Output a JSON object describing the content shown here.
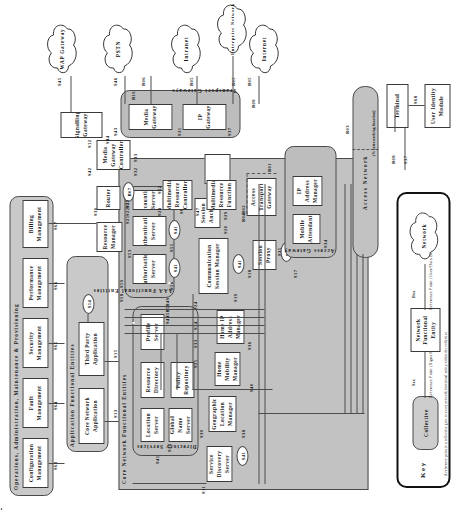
{
  "figure": {
    "type": "patent-network-architecture-diagram",
    "orientation": "rotated-90-ccw"
  },
  "collectives": {
    "oamp": {
      "label": "Operations, Administration, Maintenance & Provisioning"
    },
    "app_entities": {
      "label": "Application Functional Entities"
    },
    "core_entities": {
      "label": "Core Network Functional Entities"
    },
    "directory": {
      "label": "Directory Services"
    },
    "aaa": {
      "label": "AAA Functional Entities"
    },
    "transport_gw": {
      "label": "Transport Gateways"
    },
    "access_gw": {
      "label": "Access Gateway"
    },
    "access_network": {
      "label": "Access Network"
    },
    "access_network_note": "(% interworking function)"
  },
  "nodes": {
    "fault_mgmt": "Fault Management",
    "security_mgmt": "Security Management",
    "performance_mgmt": "Performance Management",
    "billing_mgmt": "Billing Management",
    "configuration_mgmt": "Configuration Management",
    "third_party_app": "Third Party Application",
    "core_network_app": "Core Network Application",
    "profile_server": "Profile Server",
    "policy_repository": "Policy Repository",
    "resource_directory": "Resource Directory",
    "global_name_server": "Global Name Server",
    "location_server": "Location Server",
    "service_discovery_server": "Service Discovery Server",
    "geographic_location_manager": "Geographic Location Manager",
    "home_mobility_manager": "Home Mobility Manager",
    "home_ip_address_manager": "Home IP Address Manager",
    "authorisation_server": "Authorisation Server",
    "authentication_server": "Authentication Server",
    "accounting_server": "Accounting Server",
    "communication_session_manager": "Communication Session Manager",
    "session_anchor": "Session Anchor",
    "session_proxy": "Session Proxy",
    "resource_manager": "Resource Manager",
    "router": "Router",
    "media_gateway_controller": "Media Gateway Controller",
    "multimedia_resource_controller": "Multimedia Resource Controller",
    "multimedia_resource_function": "Multimedia Resource Function",
    "signalling_gateway": "Signalling Gateway",
    "media_gateway": "Media Gateway",
    "ip_gateway": "IP Gateway",
    "access_transport_gateway": "Access Transport Gateway",
    "mobile_attendant": "Mobile Attendant",
    "ip_address_manager": "IP Address Manager",
    "terminal": "Terminal",
    "user_identity_module": "User Identity Module"
  },
  "clouds": {
    "wap_gateway": "WAP Gateway",
    "pstn": "PSTN",
    "intranet": "Intranet",
    "enterprise_network": "Enterprise Network",
    "internet": "Internet"
  },
  "refs": {
    "s11": "S11",
    "s12": "S12",
    "s13": "S13",
    "s14": "S14",
    "s15": "S15",
    "s16": "S16",
    "s17": "S17",
    "s18": "S18",
    "s19": "S19",
    "s20": "S20",
    "s21": "S21",
    "s22": "S22",
    "s23": "S23",
    "s24": "S24",
    "s25": "S25",
    "s26": "S26",
    "s27": "S27",
    "s28": "S28",
    "s29": "S29",
    "s30": "S30",
    "s31": "S31",
    "s32": "S32",
    "s33": "S33",
    "s34": "S34",
    "s35": "S35",
    "s36": "S36",
    "s37": "S37",
    "s38": "S38",
    "s39": "S39",
    "s40": "S40",
    "s41": "S41",
    "s42": "S42",
    "s43": "S43",
    "s44": "S44",
    "s45": "S45",
    "s46": "S46",
    "s47": "S47",
    "s48": "S48",
    "s49": "S49",
    "s50": "S50",
    "s51": "S51",
    "s52": "S52",
    "s53": "S53",
    "s54": "S54",
    "s55": "S55",
    "s56": "S56",
    "s57": "S57",
    "s58": "S58",
    "s59": "S59",
    "s60": "S60",
    "s61": "S61",
    "s62": "S62",
    "s63": "S63",
    "s64": "S64",
    "s65": "S65",
    "s66": "S66",
    "s67": "S67",
    "s68": "S68",
    "b01": "B01",
    "b02": "B02",
    "b03": "B03",
    "b04": "B04",
    "b05": "B05",
    "b06": "B06",
    "b07": "B07",
    "b08": "B08",
    "b09": "B09",
    "b10": "B10"
  },
  "key": {
    "title": "Key",
    "network_label": "Network",
    "bearer_ref": "Bxx",
    "bearer_desc": "Reference Point (User/Data Bearer)",
    "entity_label": "Network Functional Entity",
    "signal_ref": "Sxx",
    "signal_desc": "Reference Point (Signalling)",
    "collective_label": "Collective",
    "footnote": "A reference point to a collective goes to every network functional entity within the collective"
  }
}
